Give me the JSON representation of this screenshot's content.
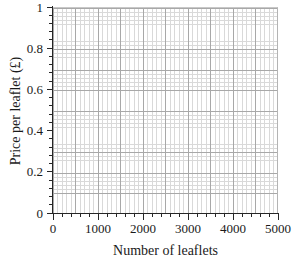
{
  "chart_data": {
    "type": "line",
    "title": "",
    "xlabel": "Number of leaflets",
    "ylabel": "Price per leaflet (£)",
    "xlim": [
      0,
      5000
    ],
    "ylim": [
      0,
      1
    ],
    "grid": "major and minor",
    "legend": "none",
    "series": [],
    "x_ticks": [
      {
        "value": 0,
        "label": "0"
      },
      {
        "value": 1000,
        "label": "1000"
      },
      {
        "value": 2000,
        "label": "2000"
      },
      {
        "value": 3000,
        "label": "3000"
      },
      {
        "value": 4000,
        "label": "4000"
      },
      {
        "value": 5000,
        "label": "5000"
      }
    ],
    "y_ticks": [
      {
        "value": 0,
        "label": "0"
      },
      {
        "value": 0.2,
        "label": "0.2"
      },
      {
        "value": 0.4,
        "label": "0.4"
      },
      {
        "value": 0.6,
        "label": "0.6"
      },
      {
        "value": 0.8,
        "label": "0.8"
      },
      {
        "value": 1,
        "label": "1"
      }
    ],
    "x_minor_per_major": 5,
    "y_minor_per_major": 5,
    "colors": {
      "axis": "#262626",
      "grid_major": "#a8a8a8",
      "grid_minor": "#d9d9d9",
      "background": "#ffffff"
    }
  }
}
